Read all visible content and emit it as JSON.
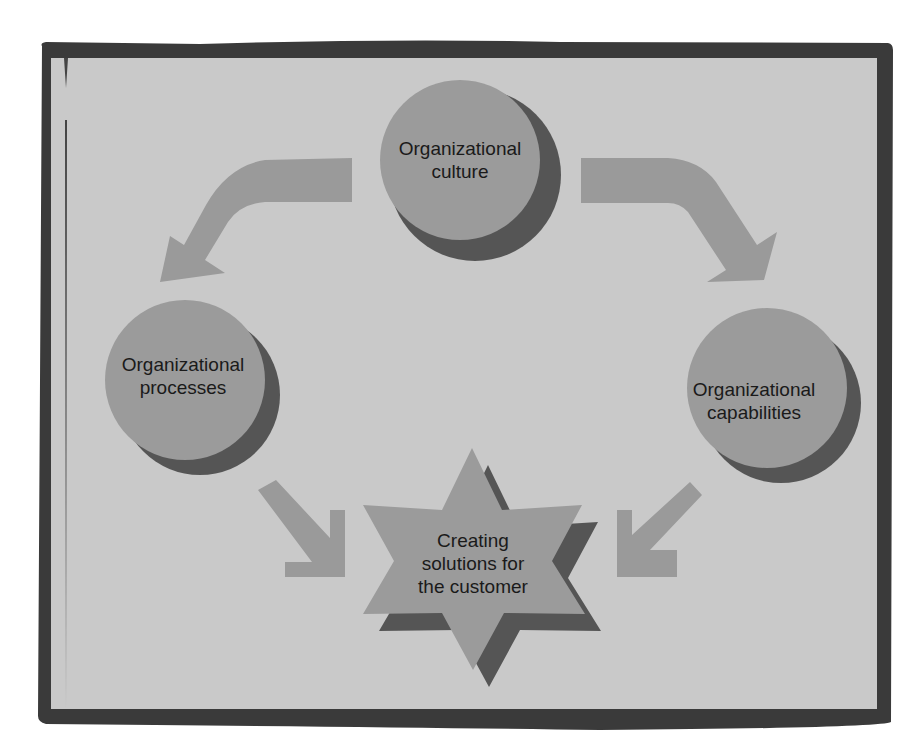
{
  "diagram": {
    "type": "cycle-flow",
    "colors": {
      "page_background": "#ffffff",
      "frame": "#3a3a3a",
      "panel": "#c9c9c9",
      "node_fill": "#9b9b9b",
      "node_shadow": "#555555",
      "arrow": "#9a9a9a",
      "text": "#1a1a1a"
    },
    "nodes": [
      {
        "id": "culture",
        "shape": "circle",
        "line1": "Organizational",
        "line2": "culture"
      },
      {
        "id": "processes",
        "shape": "circle",
        "line1": "Organizational",
        "line2": "processes"
      },
      {
        "id": "capabilities",
        "shape": "circle",
        "line1": "Organizational",
        "line2": "capabilities"
      },
      {
        "id": "solutions",
        "shape": "star",
        "line1": "Creating",
        "line2": "solutions for",
        "line3": "the customer"
      }
    ],
    "edges": [
      {
        "from": "culture",
        "to": "processes",
        "style": "curved-arrow"
      },
      {
        "from": "culture",
        "to": "capabilities",
        "style": "curved-arrow"
      },
      {
        "from": "processes",
        "to": "solutions",
        "style": "straight-arrow"
      },
      {
        "from": "capabilities",
        "to": "solutions",
        "style": "straight-arrow"
      }
    ]
  }
}
